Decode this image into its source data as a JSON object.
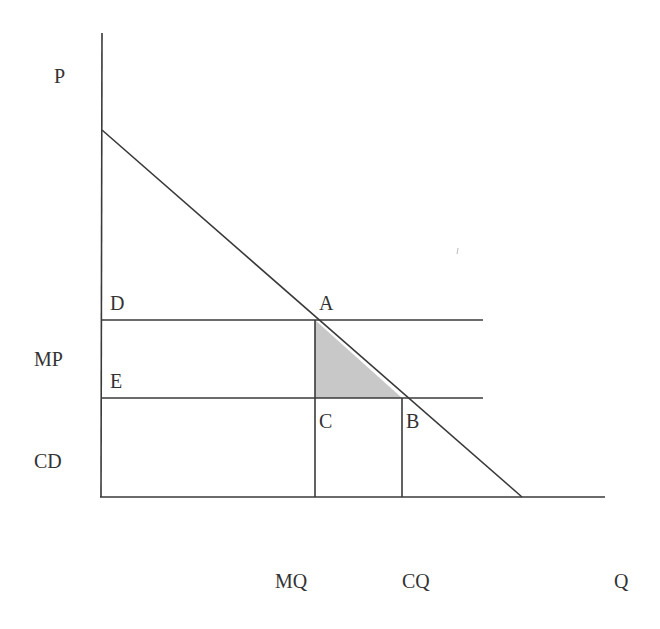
{
  "diagram": {
    "title": "",
    "type": "monopoly deadweight loss diagram",
    "axis_labels": {
      "y": "P",
      "x": "Q"
    },
    "y_labels": {
      "monopoly_price": "MP",
      "competitive_price": "CD"
    },
    "x_labels": {
      "monopoly_quantity": "MQ",
      "competitive_quantity": "CQ"
    },
    "points": {
      "D": "D",
      "E": "E",
      "A": "A",
      "B": "B",
      "C": "C"
    },
    "shaded_region": {
      "vertices": [
        "A",
        "C",
        "B"
      ],
      "fill": "#c8c8c8"
    },
    "colors": {
      "line": "#3a3a3a",
      "text": "#333333",
      "background": "#ffffff"
    }
  }
}
